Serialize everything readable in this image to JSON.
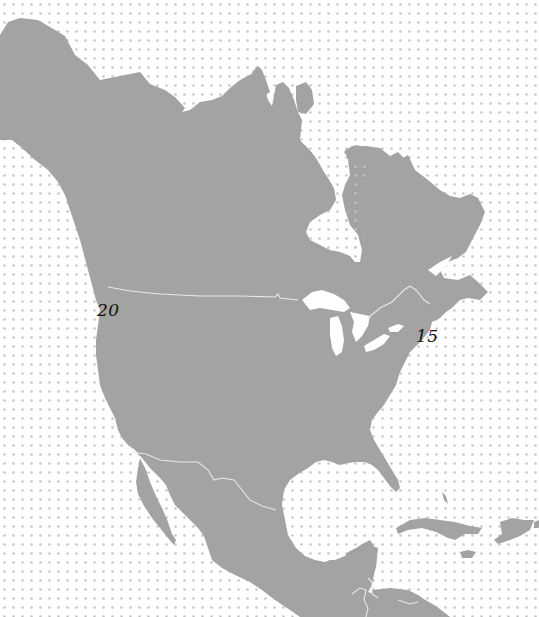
{
  "map": {
    "region": "North America",
    "colors": {
      "background": "#ffffff",
      "water_dot": "#c8c8c8",
      "land": "#a3a3a3",
      "border": "#e6e6e6",
      "label": "#111111"
    },
    "labels": [
      {
        "id": "west",
        "text": "20",
        "x": 97,
        "y": 310
      },
      {
        "id": "east",
        "text": "15",
        "x": 416,
        "y": 330
      }
    ]
  }
}
